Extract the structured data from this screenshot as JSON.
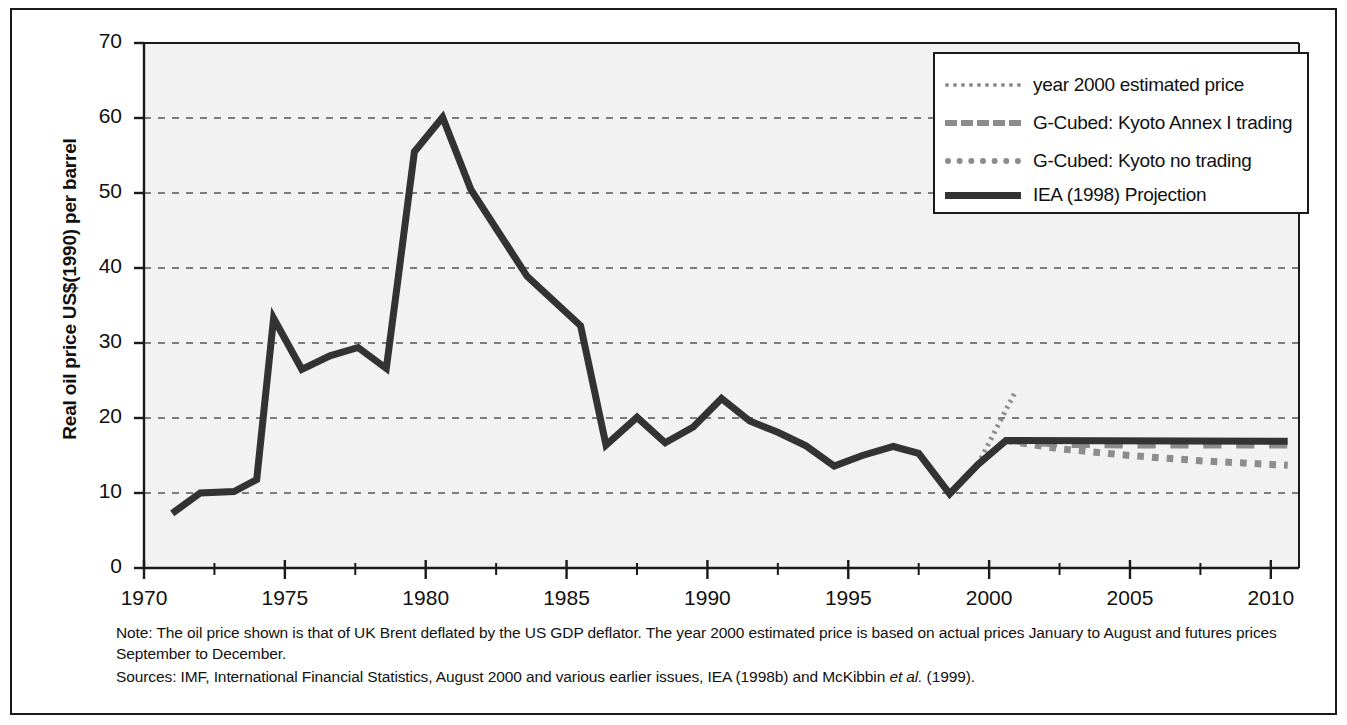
{
  "chart_data": {
    "type": "line",
    "title": "",
    "xlabel": "",
    "ylabel": "Real oil price US$(1990) per barrel",
    "xlim": [
      1970,
      2011
    ],
    "ylim": [
      0,
      70
    ],
    "grid": "horizontal-dashed",
    "legend_position": "top-right",
    "y_ticks": [
      "0",
      "10",
      "20",
      "30",
      "40",
      "50",
      "60",
      "70"
    ],
    "y_tick_values": [
      0,
      10,
      20,
      30,
      40,
      50,
      60,
      70
    ],
    "x_ticks": [
      "1970",
      "1975",
      "1980",
      "1985",
      "1990",
      "1995",
      "2000",
      "2005",
      "2010"
    ],
    "x_tick_values": [
      1970,
      1975,
      1980,
      1985,
      1990,
      1995,
      2000,
      2005,
      2010
    ],
    "x_minor_tick_values": [
      1972.5,
      1977.5,
      1982.5,
      1987.5,
      1992.5,
      1997.5,
      2002.5,
      2007.5
    ],
    "series": [
      {
        "name": "IEA (1998) Projection",
        "style": "solid",
        "color": "#333333",
        "width": 7,
        "x": [
          1971.0,
          1972.0,
          1973.2,
          1974.0,
          1974.6,
          1975.6,
          1976.6,
          1977.6,
          1978.6,
          1979.0,
          1979.6,
          1980.6,
          1981.6,
          1983.6,
          1985.5,
          1986.4,
          1987.5,
          1988.5,
          1989.5,
          1990.5,
          1991.5,
          1992.5,
          1993.5,
          1994.5,
          1995.5,
          1996.6,
          1997.5,
          1998.6,
          1999.6,
          2000.6,
          2001.0,
          2010.6
        ],
        "y": [
          7.3,
          10.0,
          10.2,
          11.8,
          33.3,
          26.5,
          28.3,
          29.4,
          26.6,
          38.0,
          55.5,
          60.1,
          50.5,
          38.9,
          32.3,
          16.4,
          20.1,
          16.7,
          18.8,
          22.6,
          19.6,
          18.1,
          16.3,
          13.6,
          15.0,
          16.2,
          15.3,
          9.9,
          13.8,
          17.0,
          17.0,
          16.9
        ]
      },
      {
        "name": "year 2000 estimated price",
        "style": "fine-dotted",
        "color": "#8c8c8c",
        "width": 5,
        "x": [
          1999.6,
          2000.9
        ],
        "y": [
          13.8,
          23.3
        ]
      },
      {
        "name": "G-Cubed: Kyoto Annex I trading",
        "style": "dashed",
        "color": "#8c8c8c",
        "width": 7,
        "x": [
          2000.6,
          2002.5,
          2005.0,
          2007.5,
          2010.6
        ],
        "y": [
          17.0,
          16.5,
          16.4,
          16.4,
          16.4
        ]
      },
      {
        "name": "G-Cubed: Kyoto no trading",
        "style": "dotted",
        "color": "#8c8c8c",
        "width": 7,
        "x": [
          2000.6,
          2002.5,
          2005.0,
          2007.5,
          2010.6
        ],
        "y": [
          17.0,
          15.9,
          15.0,
          14.3,
          13.7
        ]
      }
    ]
  },
  "legend": {
    "items": [
      {
        "label": "year 2000 estimated price",
        "style": "fine-dots"
      },
      {
        "label": "G-Cubed: Kyoto Annex I trading",
        "style": "long-dash"
      },
      {
        "label": "G-Cubed: Kyoto no trading",
        "style": "square-dots"
      },
      {
        "label": "IEA (1998) Projection",
        "style": "solid"
      }
    ]
  },
  "footnotes": {
    "note": "Note: The oil price shown is that of UK Brent deflated by the US GDP deflator. The year 2000 estimated price is based on actual prices January to August and futures prices September to December.",
    "sources_prefix": "Sources: IMF, International Financial Statistics, August 2000 and various earlier issues, IEA (1998b) and McKibbin ",
    "sources_italic": "et al.",
    "sources_suffix": " (1999)."
  },
  "colors": {
    "line_dark": "#333333",
    "line_gray": "#8c8c8c",
    "plot_background": "#f2f2f2",
    "frame": "#1a1a1a",
    "grid": "#555555"
  }
}
